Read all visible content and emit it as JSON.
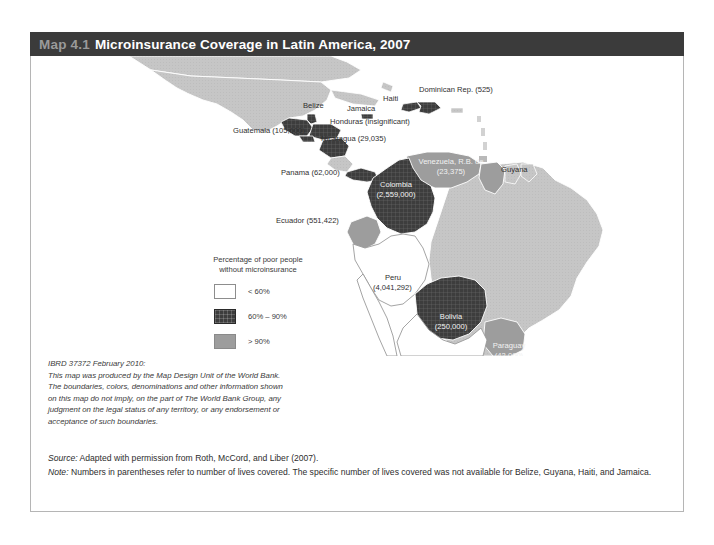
{
  "header": {
    "map_number": "Map 4.1",
    "title": "Microinsurance Coverage in Latin America, 2007"
  },
  "legend": {
    "title_line1": "Percentage of poor people",
    "title_line2": "without microinsurance",
    "items": [
      {
        "label": "< 60%",
        "swatch": "white",
        "color": "#ffffff"
      },
      {
        "label": "60% – 90%",
        "swatch": "dark",
        "color": "#3d3d3d"
      },
      {
        "label": "> 90%",
        "swatch": "mid",
        "color": "#9d9d9d"
      }
    ]
  },
  "map": {
    "labels": [
      {
        "name": "dominican-republic",
        "text": "Dominican Rep. (525)",
        "x": 388,
        "y": 36,
        "anchor": "start",
        "style": "dark"
      },
      {
        "name": "haiti",
        "text": "Haiti",
        "x": 352,
        "y": 45,
        "anchor": "start",
        "style": "dark"
      },
      {
        "name": "belize",
        "text": "Belize",
        "x": 272,
        "y": 52,
        "anchor": "start",
        "style": "dark"
      },
      {
        "name": "jamaica",
        "text": "Jamaica",
        "x": 316,
        "y": 55,
        "anchor": "start",
        "style": "dark"
      },
      {
        "name": "honduras",
        "text": "Honduras (insignificant)",
        "x": 299,
        "y": 68,
        "anchor": "start",
        "style": "dark"
      },
      {
        "name": "guatemala",
        "text": "Guatemala (105,600)",
        "x": 202,
        "y": 77,
        "anchor": "start",
        "style": "dark"
      },
      {
        "name": "nicaragua",
        "text": "Nicaragua (29,035)",
        "x": 290,
        "y": 85,
        "anchor": "start",
        "style": "dark"
      },
      {
        "name": "venezuela",
        "text": "Venezuela, R.B. de",
        "x": 420,
        "y": 108,
        "anchor": "middle",
        "style": "light"
      },
      {
        "name": "venezuela-value",
        "text": "(23,375)",
        "x": 420,
        "y": 118,
        "anchor": "middle",
        "style": "light"
      },
      {
        "name": "guyana",
        "text": "Guyana",
        "x": 470,
        "y": 116,
        "anchor": "start",
        "style": "dark"
      },
      {
        "name": "panama",
        "text": "Panama (62,000)",
        "x": 250,
        "y": 119,
        "anchor": "start",
        "style": "dark"
      },
      {
        "name": "colombia",
        "text": "Colombia",
        "x": 365,
        "y": 131,
        "anchor": "middle",
        "style": "light"
      },
      {
        "name": "colombia-value",
        "text": "(2,559,000)",
        "x": 365,
        "y": 141,
        "anchor": "middle",
        "style": "light"
      },
      {
        "name": "ecuador",
        "text": "Ecuador (551,422)",
        "x": 245,
        "y": 167,
        "anchor": "start",
        "style": "dark"
      },
      {
        "name": "peru",
        "text": "Peru",
        "x": 354,
        "y": 224,
        "anchor": "start",
        "style": "dark"
      },
      {
        "name": "peru-value",
        "text": "(4,041,292)",
        "x": 342,
        "y": 234,
        "anchor": "start",
        "style": "dark"
      },
      {
        "name": "bolivia",
        "text": "Bolivia",
        "x": 420,
        "y": 263,
        "anchor": "middle",
        "style": "light"
      },
      {
        "name": "bolivia-value",
        "text": "(250,000)",
        "x": 420,
        "y": 273,
        "anchor": "middle",
        "style": "light"
      },
      {
        "name": "paraguay",
        "text": "Paraguay",
        "x": 478,
        "y": 292,
        "anchor": "middle",
        "style": "light"
      },
      {
        "name": "paraguay-value",
        "text": "(42,000)",
        "x": 478,
        "y": 302,
        "anchor": "middle",
        "style": "light"
      }
    ],
    "colors": {
      "low": "#c6c6c6",
      "mid": "#9d9d9d",
      "high": "#3d3d3d",
      "white": "#ffffff",
      "outline": "#ffffff"
    }
  },
  "disclaimer": {
    "line1": "IBRD 37372 February 2010:",
    "line2": "This map was produced by the Map Design Unit of the World Bank.",
    "line3": "The boundaries, colors, denominations and other information shown",
    "line4": "on this map do not imply, on the part of The World Bank Group, any",
    "line5": "judgment on the legal status of any territory, or any endorsement or",
    "line6": "acceptance of such boundaries."
  },
  "footer": {
    "source_label": "Source:",
    "source_text": " Adapted with permission from Roth, McCord, and Liber (2007).",
    "note_label": "Note:",
    "note_text": " Numbers in parentheses refer to number of lives covered. The specific number of lives covered was not available for Belize, Guyana, Haiti, and Jamaica."
  }
}
